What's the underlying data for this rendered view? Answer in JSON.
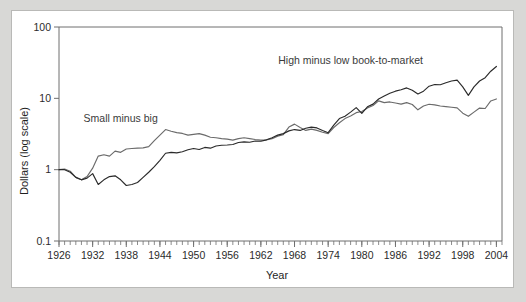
{
  "chart_data": {
    "type": "line",
    "title": "",
    "xlabel": "Year",
    "ylabel": "Dollars (log scale)",
    "yscale": "log",
    "ylim": [
      0.1,
      100
    ],
    "xlim": [
      1926,
      2005
    ],
    "ytick_labels": [
      "100",
      "10",
      "1",
      "0.1"
    ],
    "ytick_values": [
      100,
      10,
      1,
      0.1
    ],
    "xtick_labels": [
      "1926",
      "1932",
      "1938",
      "1944",
      "1950",
      "1956",
      "1962",
      "1968",
      "1974",
      "1980",
      "1986",
      "1992",
      "1998",
      "2004"
    ],
    "xtick_values": [
      1926,
      1932,
      1938,
      1944,
      1950,
      1956,
      1962,
      1968,
      1974,
      1980,
      1986,
      1992,
      1998,
      2004
    ],
    "minor_tick_interval": 1,
    "grid": false,
    "legend_position": "inline-annotation",
    "series": [
      {
        "name": "Small minus big",
        "color": "#6b6b6b",
        "label_x": 1937,
        "label_y": 4.6,
        "x": [
          1926,
          1927,
          1928,
          1929,
          1930,
          1931,
          1932,
          1933,
          1934,
          1935,
          1936,
          1937,
          1938,
          1939,
          1940,
          1941,
          1942,
          1943,
          1944,
          1945,
          1946,
          1947,
          1948,
          1949,
          1950,
          1951,
          1952,
          1953,
          1954,
          1955,
          1956,
          1957,
          1958,
          1959,
          1960,
          1961,
          1962,
          1963,
          1964,
          1965,
          1966,
          1967,
          1968,
          1969,
          1970,
          1971,
          1972,
          1973,
          1974,
          1975,
          1976,
          1977,
          1978,
          1979,
          1980,
          1981,
          1982,
          1983,
          1984,
          1985,
          1986,
          1987,
          1988,
          1989,
          1990,
          1991,
          1992,
          1993,
          1994,
          1995,
          1996,
          1997,
          1998,
          1999,
          2000,
          2001,
          2002,
          2003,
          2004
        ],
        "values": [
          1.0,
          1.02,
          0.95,
          0.78,
          0.72,
          0.8,
          1.05,
          1.55,
          1.62,
          1.55,
          1.82,
          1.75,
          1.95,
          1.98,
          2.0,
          2.02,
          2.1,
          2.55,
          3.05,
          3.65,
          3.45,
          3.3,
          3.22,
          3.05,
          3.12,
          3.2,
          3.05,
          2.85,
          2.8,
          2.72,
          2.68,
          2.6,
          2.72,
          2.8,
          2.72,
          2.65,
          2.6,
          2.62,
          2.72,
          2.95,
          3.1,
          3.95,
          4.35,
          3.9,
          3.55,
          3.7,
          3.55,
          3.35,
          3.2,
          3.9,
          4.55,
          5.2,
          5.65,
          6.3,
          6.55,
          7.3,
          7.95,
          9.2,
          8.7,
          8.9,
          8.6,
          8.3,
          8.7,
          8.2,
          6.9,
          7.8,
          8.25,
          8.1,
          7.8,
          7.65,
          7.5,
          7.35,
          6.2,
          5.6,
          6.4,
          7.3,
          7.2,
          9.2,
          9.8
        ]
      },
      {
        "name": "High minus low book-to-market",
        "color": "#2a2a2a",
        "label_x": 1978,
        "label_y": 30,
        "x": [
          1926,
          1927,
          1928,
          1929,
          1930,
          1931,
          1932,
          1933,
          1934,
          1935,
          1936,
          1937,
          1938,
          1939,
          1940,
          1941,
          1942,
          1943,
          1944,
          1945,
          1946,
          1947,
          1948,
          1949,
          1950,
          1951,
          1952,
          1953,
          1954,
          1955,
          1956,
          1957,
          1958,
          1959,
          1960,
          1961,
          1962,
          1963,
          1964,
          1965,
          1966,
          1967,
          1968,
          1969,
          1970,
          1971,
          1972,
          1973,
          1974,
          1975,
          1976,
          1977,
          1978,
          1979,
          1980,
          1981,
          1982,
          1983,
          1984,
          1985,
          1986,
          1987,
          1988,
          1989,
          1990,
          1991,
          1992,
          1993,
          1994,
          1995,
          1996,
          1997,
          1998,
          1999,
          2000,
          2001,
          2002,
          2003,
          2004
        ],
        "values": [
          1.0,
          1.0,
          0.92,
          0.78,
          0.72,
          0.76,
          0.88,
          0.62,
          0.72,
          0.8,
          0.82,
          0.72,
          0.6,
          0.62,
          0.66,
          0.78,
          0.92,
          1.1,
          1.35,
          1.7,
          1.75,
          1.72,
          1.78,
          1.9,
          1.98,
          1.92,
          2.05,
          2.0,
          2.15,
          2.2,
          2.22,
          2.25,
          2.4,
          2.45,
          2.42,
          2.52,
          2.5,
          2.62,
          2.8,
          3.05,
          3.2,
          3.5,
          3.65,
          3.55,
          3.8,
          3.95,
          3.85,
          3.55,
          3.3,
          4.2,
          5.2,
          5.6,
          6.4,
          7.4,
          6.15,
          7.6,
          8.3,
          9.8,
          10.8,
          11.8,
          12.6,
          13.2,
          14.0,
          13.0,
          11.5,
          12.6,
          14.8,
          15.6,
          15.5,
          16.5,
          17.5,
          18.0,
          14.5,
          11.0,
          14.5,
          17.5,
          19.5,
          24.0,
          28.0
        ]
      }
    ]
  }
}
